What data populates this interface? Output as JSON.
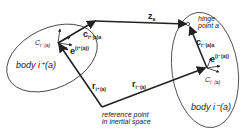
{
  "diagram": {
    "bodies": {
      "left": {
        "label": "body i⁺(a)",
        "centroid_label": "C",
        "centroid_sub": "i⁺(a)"
      },
      "right": {
        "label": "body i⁻(a)",
        "centroid_label": "C",
        "centroid_sub": "i⁻(a)"
      }
    },
    "vectors": {
      "z": {
        "label": "z",
        "sub": "a"
      },
      "c_left": {
        "label": "c",
        "sub": "i⁺(a)a"
      },
      "c_right": {
        "label": "c",
        "sub": "i⁻(a)a"
      },
      "e_left": {
        "label": "e",
        "sup": "(i⁺(a))"
      },
      "e_right": {
        "label": "e",
        "sup": "(i⁻(a))"
      },
      "r_left": {
        "label": "r",
        "sub": "i⁺(a)"
      },
      "r_right": {
        "label": "r",
        "sub": "i⁻(a)"
      }
    },
    "hinge": {
      "line1": "hinge",
      "line2": "point a"
    },
    "reference": {
      "line1": "reference point",
      "line2": "in inertial space"
    },
    "colors": {
      "stroke": "#222222",
      "background": "#ffffff"
    }
  }
}
